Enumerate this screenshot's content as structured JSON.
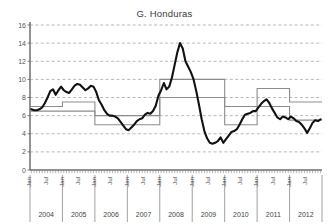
{
  "chart_data": {
    "type": "line",
    "title": "G. Honduras",
    "xlabel": "",
    "ylabel": "",
    "ylim": [
      0,
      16
    ],
    "yticks": [
      0,
      2,
      4,
      6,
      8,
      10,
      12,
      14,
      16
    ],
    "grid": true,
    "legend_position": "none",
    "years": [
      "2004",
      "2005",
      "2006",
      "2007",
      "2008",
      "2009",
      "2010",
      "2011",
      "2012"
    ],
    "month_ticks": [
      "Jan",
      "Jul"
    ],
    "x_start": "2004-01",
    "x_end": "2012-12",
    "series": [
      {
        "name": "Inflation",
        "style": "thick-black-line",
        "color": "#111111",
        "values": [
          6.7,
          6.6,
          6.6,
          6.7,
          6.9,
          7.4,
          8.0,
          8.7,
          8.9,
          8.3,
          8.8,
          9.2,
          8.8,
          8.6,
          8.5,
          8.9,
          9.3,
          9.5,
          9.4,
          9.1,
          8.8,
          9.0,
          9.3,
          9.2,
          8.6,
          7.7,
          7.2,
          6.6,
          6.2,
          6.0,
          6.0,
          5.9,
          5.7,
          5.3,
          4.9,
          4.5,
          4.4,
          4.7,
          5.0,
          5.4,
          5.6,
          5.7,
          6.1,
          6.3,
          6.2,
          6.5,
          7.1,
          8.2,
          8.8,
          9.6,
          8.9,
          9.2,
          10.2,
          11.6,
          13.0,
          14.0,
          13.4,
          12.0,
          11.4,
          10.8,
          10.0,
          8.7,
          7.2,
          5.6,
          4.3,
          3.5,
          3.0,
          2.9,
          3.0,
          3.2,
          3.6,
          3.0,
          3.4,
          3.8,
          4.2,
          4.3,
          4.5,
          5.0,
          5.6,
          6.1,
          6.2,
          6.3,
          6.5,
          6.5,
          6.9,
          7.3,
          7.6,
          7.8,
          7.4,
          6.8,
          6.3,
          5.8,
          5.6,
          5.9,
          5.8,
          5.6,
          5.9,
          5.7,
          5.4,
          5.3,
          5.0,
          4.6,
          4.1,
          4.6,
          5.2,
          5.5,
          5.4,
          5.6
        ]
      },
      {
        "name": "Target band upper",
        "style": "thin-gray-step",
        "color": "#8d8d8d",
        "steps": [
          {
            "from": "2004-01",
            "to": "2004-12",
            "value": 7.0
          },
          {
            "from": "2005-01",
            "to": "2005-12",
            "value": 7.5
          },
          {
            "from": "2006-01",
            "to": "2006-12",
            "value": 6.0
          },
          {
            "from": "2007-01",
            "to": "2007-12",
            "value": 6.0
          },
          {
            "from": "2008-01",
            "to": "2008-12",
            "value": 10.0
          },
          {
            "from": "2009-01",
            "to": "2009-12",
            "value": 10.0
          },
          {
            "from": "2010-01",
            "to": "2010-12",
            "value": 7.0
          },
          {
            "from": "2011-01",
            "to": "2011-12",
            "value": 9.0
          },
          {
            "from": "2012-01",
            "to": "2012-12",
            "value": 7.5
          }
        ]
      },
      {
        "name": "Target band lower",
        "style": "thin-gray-step",
        "color": "#8d8d8d",
        "steps": [
          {
            "from": "2004-01",
            "to": "2004-12",
            "value": 6.5
          },
          {
            "from": "2005-01",
            "to": "2005-12",
            "value": 6.5
          },
          {
            "from": "2006-01",
            "to": "2006-12",
            "value": 5.0
          },
          {
            "from": "2007-01",
            "to": "2007-12",
            "value": 5.0
          },
          {
            "from": "2008-01",
            "to": "2008-12",
            "value": 8.0
          },
          {
            "from": "2009-01",
            "to": "2009-12",
            "value": 8.0
          },
          {
            "from": "2010-01",
            "to": "2010-12",
            "value": 5.0
          },
          {
            "from": "2011-01",
            "to": "2011-12",
            "value": 7.0
          },
          {
            "from": "2012-01",
            "to": "2012-12",
            "value": 5.5
          }
        ]
      }
    ]
  }
}
